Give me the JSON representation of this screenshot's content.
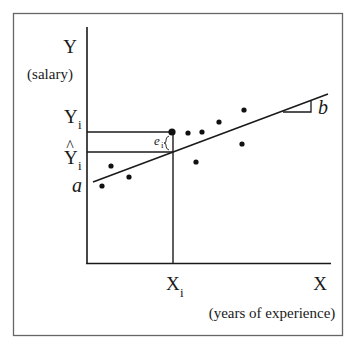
{
  "diagram": {
    "type": "linear-regression-illustration",
    "y_axis": {
      "label": "Y",
      "sublabel": "(salary)"
    },
    "x_axis": {
      "label": "X",
      "sublabel": "(years of experience)"
    },
    "annotations": {
      "observed_y": "Y",
      "observed_y_sub": "i",
      "predicted_y": "Y",
      "predicted_y_hat": "^",
      "predicted_y_sub": "i",
      "intercept": "a",
      "slope": "b",
      "residual": "e",
      "residual_sub": "i",
      "x_value": "X",
      "x_value_sub": "i"
    },
    "colors": {
      "ink": "#1a1a1a",
      "frame": "#555555",
      "background": "#ffffff"
    },
    "points": [
      {
        "x": 102,
        "y": 186
      },
      {
        "x": 111,
        "y": 166
      },
      {
        "x": 129,
        "y": 177
      },
      {
        "x": 172,
        "y": 132,
        "highlight": true
      },
      {
        "x": 188,
        "y": 133
      },
      {
        "x": 196,
        "y": 162
      },
      {
        "x": 202,
        "y": 132
      },
      {
        "x": 219,
        "y": 122
      },
      {
        "x": 242,
        "y": 144
      },
      {
        "x": 244,
        "y": 110
      }
    ],
    "regression_line": {
      "x1": 93,
      "y1": 182,
      "x2": 328,
      "y2": 94
    }
  }
}
